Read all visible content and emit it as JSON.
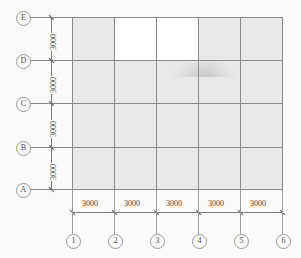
{
  "drawing": {
    "type": "structural-column-grid-plan",
    "units": "mm",
    "fill_color": "#e9e9e9",
    "line_color": "#8a8a8a",
    "background_color": "#fbfbfa"
  },
  "vertical_axis": {
    "label_text": "row-grid-labels",
    "labels": [
      "E",
      "D",
      "C",
      "B",
      "A"
    ],
    "dimensions": [
      "3000",
      "3000",
      "3000",
      "3000"
    ],
    "total_spans": 4
  },
  "horizontal_axis": {
    "label_text": "column-grid-labels",
    "labels": [
      "1",
      "2",
      "3",
      "4",
      "5",
      "6"
    ],
    "dimensions": [
      "3000",
      "3000",
      "3000",
      "3000",
      "3000"
    ],
    "total_spans": 5
  },
  "bays": {
    "rows": [
      "D-E",
      "C-D",
      "B-C",
      "A-B"
    ],
    "columns": [
      "1-2",
      "2-3",
      "3-4",
      "4-5",
      "5-6"
    ],
    "shading": [
      [
        "shaded",
        "blank",
        "blank",
        "shaded",
        "shaded"
      ],
      [
        "shaded",
        "shaded",
        "shaded",
        "shaded",
        "shaded"
      ],
      [
        "shaded",
        "shaded",
        "shaded",
        "shaded",
        "shaded"
      ],
      [
        "shaded",
        "shaded",
        "shaded",
        "shaded",
        "shaded"
      ]
    ]
  }
}
